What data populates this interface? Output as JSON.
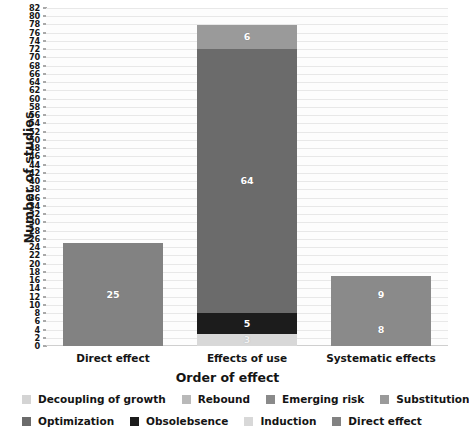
{
  "chart_data": {
    "type": "bar",
    "subtype": "stacked-bar",
    "title": "",
    "xlabel": "Order of effect",
    "ylabel": "Number of studies",
    "ylim": [
      0,
      82
    ],
    "ytick_step": 2,
    "yticks": [
      0,
      2,
      4,
      6,
      8,
      10,
      12,
      14,
      16,
      18,
      20,
      22,
      24,
      26,
      28,
      30,
      32,
      34,
      36,
      38,
      40,
      42,
      44,
      46,
      48,
      50,
      52,
      54,
      56,
      58,
      60,
      62,
      64,
      66,
      68,
      70,
      72,
      74,
      76,
      78,
      80,
      82
    ],
    "grid": true,
    "legend_position": "bottom",
    "categories": [
      "Direct effect",
      "Effects of use",
      "Systematic effects"
    ],
    "series": [
      {
        "name": "Decoupling of growth",
        "color": "#d4d4d4",
        "values": [
          0,
          0,
          0
        ]
      },
      {
        "name": "Rebound",
        "color": "#b9b9b9",
        "values": [
          0,
          0,
          9
        ]
      },
      {
        "name": "Emerging risk",
        "color": "#8a8a8a",
        "values": [
          0,
          0,
          8
        ]
      },
      {
        "name": "Substitution",
        "color": "#9a9a9a",
        "values": [
          0,
          6,
          0
        ]
      },
      {
        "name": "Optimization",
        "color": "#6b6b6b",
        "values": [
          0,
          64,
          0
        ]
      },
      {
        "name": "Obsolebsence",
        "color": "#1c1c1c",
        "values": [
          0,
          5,
          0
        ]
      },
      {
        "name": "Induction",
        "color": "#d8d8d8",
        "values": [
          0,
          3,
          0
        ]
      },
      {
        "name": "Direct effect",
        "color": "#828282",
        "values": [
          25,
          0,
          0
        ]
      }
    ],
    "bars": [
      {
        "category": "Direct effect",
        "total": 25,
        "segments": [
          {
            "series": "Direct effect",
            "value": 25,
            "label": "25",
            "color": "#828282",
            "label_color": "#ffffff"
          }
        ]
      },
      {
        "category": "Effects of use",
        "total": 78,
        "segments": [
          {
            "series": "Induction",
            "value": 3,
            "label": "3",
            "color": "#d8d8d8",
            "label_color": "#f0f0f0"
          },
          {
            "series": "Obsolebsence",
            "value": 5,
            "label": "5",
            "color": "#1c1c1c",
            "label_color": "#ffffff"
          },
          {
            "series": "Optimization",
            "value": 64,
            "label": "64",
            "color": "#6b6b6b",
            "label_color": "#ffffff"
          },
          {
            "series": "Substitution",
            "value": 6,
            "label": "6",
            "color": "#9a9a9a",
            "label_color": "#ffffff"
          }
        ]
      },
      {
        "category": "Systematic effects",
        "total": 17,
        "segments": [
          {
            "series": "Emerging risk",
            "value": 8,
            "label": "8",
            "color": "#8a8a8a",
            "label_color": "#ffffff"
          },
          {
            "series": "Rebound",
            "value": 9,
            "label": "9",
            "color": "#8a8a8a",
            "label_color": "#ffffff"
          }
        ]
      }
    ]
  },
  "legend": {
    "rows": [
      [
        {
          "label": "Decoupling of growth",
          "color": "#d4d4d4"
        },
        {
          "label": "Rebound",
          "color": "#b9b9b9"
        },
        {
          "label": "Emerging risk",
          "color": "#8a8a8a"
        },
        {
          "label": "Substitution",
          "color": "#9a9a9a"
        }
      ],
      [
        {
          "label": "Optimization",
          "color": "#6b6b6b"
        },
        {
          "label": "Obsolebsence",
          "color": "#1c1c1c"
        },
        {
          "label": "Induction",
          "color": "#d8d8d8"
        },
        {
          "label": "Direct effect",
          "color": "#828282"
        }
      ]
    ]
  }
}
